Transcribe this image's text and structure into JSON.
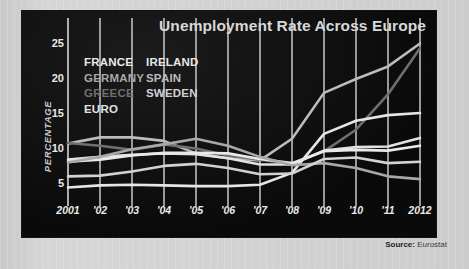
{
  "title": "Unemployment Rate Across Europe",
  "source": {
    "prefix": "Source:",
    "value": "Eurostat"
  },
  "legend": {
    "left": [
      {
        "label": "FRANCE",
        "color": "#e9e9e9"
      },
      {
        "label": "GERMANY",
        "color": "#a8a8a8"
      },
      {
        "label": "GREECE",
        "color": "#6f6f6f"
      },
      {
        "label": "EURO",
        "color": "#e2e2e2"
      }
    ],
    "right": [
      {
        "label": "IRELAND",
        "color": "#e6e6e6"
      },
      {
        "label": "SPAIN",
        "color": "#bcbcbc"
      },
      {
        "label": "SWEDEN",
        "color": "#d2d2d2"
      }
    ]
  },
  "chart_data": {
    "type": "line",
    "title": "Unemployment Rate Across Europe",
    "xlabel": "",
    "ylabel": "PERCENTAGE",
    "x": [
      2001,
      2002,
      2003,
      2004,
      2005,
      2006,
      2007,
      2008,
      2009,
      2010,
      2011,
      2012
    ],
    "tick_labels": [
      "2001",
      "'02",
      "'03",
      "'04",
      "'05",
      "'06",
      "'07",
      "'08",
      "'09",
      "'10",
      "'11",
      "2012"
    ],
    "yticks": [
      5,
      10,
      15,
      20,
      25
    ],
    "ylim": [
      2.5,
      25.5
    ],
    "xlim": [
      2001,
      2012
    ],
    "grid": true,
    "legend_position": "inside-top-left",
    "series": [
      {
        "name": "SPAIN",
        "color": "#bcbcbc",
        "values": [
          10.6,
          11.5,
          11.5,
          11.0,
          9.2,
          8.5,
          8.2,
          11.3,
          17.9,
          19.9,
          21.7,
          25.0
        ]
      },
      {
        "name": "GREECE",
        "color": "#6f6f6f",
        "values": [
          10.7,
          10.3,
          9.7,
          10.5,
          9.9,
          8.9,
          8.3,
          7.7,
          9.5,
          12.6,
          17.7,
          24.3
        ]
      },
      {
        "name": "IRELAND",
        "color": "#e6e6e6",
        "values": [
          4.3,
          4.6,
          4.7,
          4.6,
          4.5,
          4.5,
          4.7,
          6.4,
          12.0,
          13.9,
          14.7,
          15.0
        ]
      },
      {
        "name": "EURO",
        "color": "#e2e2e2",
        "values": [
          8.3,
          8.7,
          9.0,
          9.2,
          9.1,
          8.5,
          7.6,
          7.6,
          9.6,
          10.1,
          10.2,
          11.4
        ]
      },
      {
        "name": "FRANCE",
        "color": "#e9e9e9",
        "values": [
          8.0,
          8.3,
          8.9,
          9.3,
          9.3,
          9.2,
          8.4,
          7.8,
          9.5,
          9.7,
          9.6,
          10.3
        ]
      },
      {
        "name": "GERMANY",
        "color": "#a8a8a8",
        "values": [
          7.9,
          8.7,
          9.8,
          10.5,
          11.3,
          10.3,
          8.7,
          7.5,
          7.8,
          7.1,
          5.9,
          5.5
        ]
      },
      {
        "name": "SWEDEN",
        "color": "#d2d2d2",
        "values": [
          5.9,
          6.0,
          6.6,
          7.4,
          7.7,
          7.1,
          6.2,
          6.3,
          8.4,
          8.6,
          7.8,
          8.0
        ]
      }
    ]
  }
}
